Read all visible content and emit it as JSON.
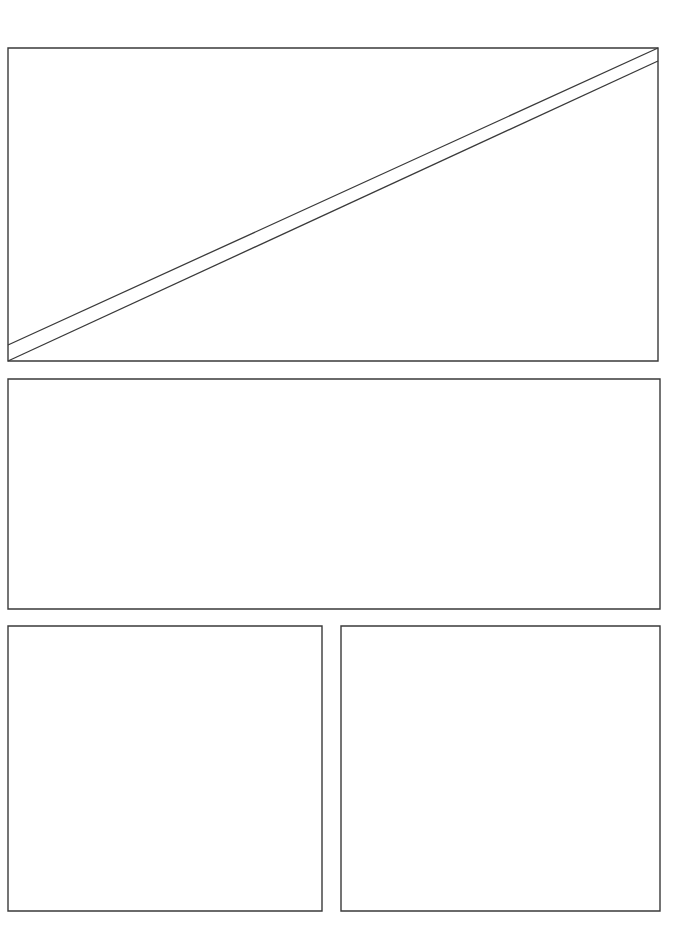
{
  "canvas": {
    "width": 689,
    "height": 950,
    "background_color": "#ffffff",
    "stroke_color": "#3a3a3a",
    "stroke_width": 1.4
  },
  "layout": {
    "title": "",
    "description": "Blank wireframe comic-style page layout with four empty rectangular panels",
    "panel_count": 4
  },
  "panels": [
    {
      "id": "panel-1",
      "name": "top-wide-panel",
      "label": "",
      "x": 8,
      "y": 48,
      "width": 650,
      "height": 313,
      "shape": "rectangle-with-diagonal-sliver",
      "outline_path": "M 8 48 L 658 48 L 658 361 L 8 361 Z",
      "annotations": [
        {
          "id": "diagonal-upper",
          "name": "diagonal-line-upper",
          "x1": 8,
          "y1": 345,
          "x2": 658,
          "y2": 48
        },
        {
          "id": "diagonal-lower",
          "name": "diagonal-line-lower",
          "x1": 8,
          "y1": 361,
          "x2": 658,
          "y2": 61
        }
      ]
    },
    {
      "id": "panel-2",
      "name": "middle-wide-panel",
      "label": "",
      "x": 8,
      "y": 379,
      "width": 652,
      "height": 230,
      "shape": "rectangle",
      "outline_path": "M 8 379 L 660 379 L 660 609 L 8 609 Z",
      "annotations": []
    },
    {
      "id": "panel-3",
      "name": "bottom-left-panel",
      "label": "",
      "x": 8,
      "y": 626,
      "width": 314,
      "height": 285,
      "shape": "rectangle",
      "outline_path": "M 8 626 L 322 626 L 322 911 L 8 911 Z",
      "annotations": []
    },
    {
      "id": "panel-4",
      "name": "bottom-right-panel",
      "label": "",
      "x": 341,
      "y": 626,
      "width": 319,
      "height": 285,
      "shape": "rectangle",
      "outline_path": "M 341 626 L 660 626 L 660 911 L 341 911 Z",
      "annotations": []
    }
  ]
}
